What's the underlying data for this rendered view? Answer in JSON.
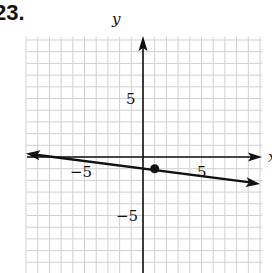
{
  "problem": {
    "number": "23."
  },
  "chart_data": {
    "type": "line",
    "title": "",
    "xlabel": "x",
    "ylabel": "y",
    "xlim": [
      -10,
      10
    ],
    "ylim": [
      -10,
      10
    ],
    "grid": true,
    "ticks": {
      "x": [
        "-5",
        "5"
      ],
      "y": [
        "5",
        "-5"
      ]
    },
    "x_tick_values": [
      -5,
      5
    ],
    "y_tick_values": [
      5,
      -5
    ],
    "series": [
      {
        "name": "line",
        "x": [
          -10,
          1,
          10
        ],
        "y": [
          0.3,
          -1,
          -2.3
        ],
        "arrows": "both"
      }
    ],
    "points": [
      {
        "x": 1,
        "y": -1,
        "style": "filled-dot"
      }
    ]
  },
  "labels": {
    "x_axis": "x",
    "y_axis": "y",
    "tick_neg5_x": "−5",
    "tick_5_x": "5",
    "tick_5_y": "5",
    "tick_neg5_y": "−5"
  },
  "colors": {
    "grid": "#d0d0d0",
    "axis": "#111111",
    "line": "#111111"
  }
}
